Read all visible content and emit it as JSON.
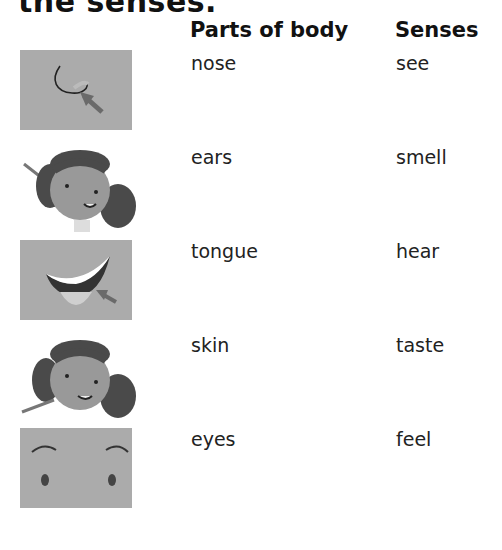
{
  "title": "the senses.",
  "headers": {
    "parts": "Parts of body",
    "senses": "Senses"
  },
  "parts": [
    "nose",
    "ears",
    "tongue",
    "skin",
    "eyes"
  ],
  "senses": [
    "see",
    "smell",
    "hear",
    "taste",
    "feel"
  ],
  "images": [
    {
      "name": "nose-picture",
      "desc": "nose with arrow"
    },
    {
      "name": "ears-picture",
      "desc": "girl with arrow pointing at ear"
    },
    {
      "name": "tongue-picture",
      "desc": "mouth with tongue and arrow"
    },
    {
      "name": "skin-picture",
      "desc": "girl with arrow pointing at chin"
    },
    {
      "name": "eyes-picture",
      "desc": "eyes and eyebrows"
    }
  ]
}
